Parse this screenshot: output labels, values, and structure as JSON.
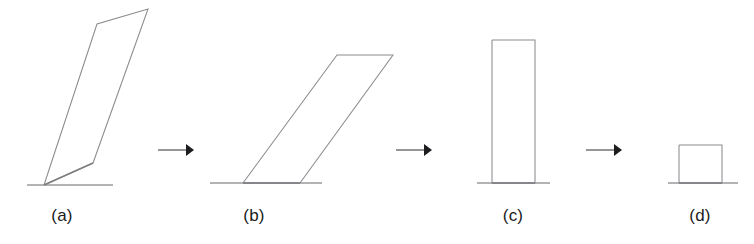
{
  "figure": {
    "background_color": "#ffffff",
    "stroke_color": "#8c8c90",
    "ground_color": "#9a9a9e",
    "arrow_color": "#1d1d20",
    "label_color": "#1b1b1b",
    "width": 754,
    "height": 244,
    "baseline_y": 183
  },
  "panels": [
    {
      "id": "panel-a",
      "label": "(a)",
      "label_x": 62,
      "label_y": 225,
      "shape_type": "leaning-polygon",
      "points": "44,185 97,24 148,9 93,163 44,185",
      "ground": {
        "x1": 27,
        "y1": 185,
        "x2": 113,
        "y2": 185
      },
      "base_edge": {
        "x1": 44,
        "y1": 185,
        "x2": 93,
        "y2": 163
      }
    },
    {
      "id": "panel-b",
      "label": "(b)",
      "label_x": 254,
      "label_y": 225,
      "shape_type": "parallelogram",
      "points": "243,183 337,55 393,55 300,183 243,183",
      "ground": {
        "x1": 210,
        "y1": 183,
        "x2": 322,
        "y2": 183
      },
      "base_edge": {
        "x1": 243,
        "y1": 183,
        "x2": 300,
        "y2": 183
      }
    },
    {
      "id": "panel-c",
      "label": "(c)",
      "label_x": 513,
      "label_y": 225,
      "shape_type": "tall-rectangle",
      "points": "492,40 535,40 535,183 492,183 492,40",
      "ground": {
        "x1": 477,
        "y1": 183,
        "x2": 550,
        "y2": 183
      },
      "base_edge": {
        "x1": 492,
        "y1": 183,
        "x2": 535,
        "y2": 183
      }
    },
    {
      "id": "panel-d",
      "label": "(d)",
      "label_x": 700,
      "label_y": 225,
      "shape_type": "square",
      "points": "679,145 722,145 722,183 679,183 679,145",
      "ground": {
        "x1": 668,
        "y1": 183,
        "x2": 738,
        "y2": 183
      },
      "base_edge": {
        "x1": 679,
        "y1": 183,
        "x2": 722,
        "y2": 183
      }
    }
  ],
  "arrows": [
    {
      "id": "arrow-a-to-b",
      "x1": 158,
      "y1": 150,
      "x2": 192,
      "y2": 150,
      "head": "186,144 194,150 186,156"
    },
    {
      "id": "arrow-b-to-c",
      "x1": 396,
      "y1": 150,
      "x2": 430,
      "y2": 150,
      "head": "424,144 432,150 424,156"
    },
    {
      "id": "arrow-c-to-d",
      "x1": 586,
      "y1": 150,
      "x2": 620,
      "y2": 150,
      "head": "614,144 622,150 614,156"
    }
  ]
}
